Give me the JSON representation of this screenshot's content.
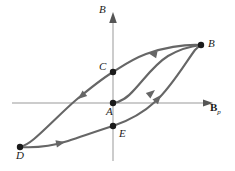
{
  "figure": {
    "type": "hysteresis-loop-diagram",
    "title": "",
    "background_color": "#ffffff",
    "curve_color": "#666666",
    "axis_color": "#999999",
    "point_color": "#1a1a1a",
    "text_color": "#1a1a1a"
  },
  "axes": {
    "y": {
      "label": "B",
      "label_x": 99,
      "label_y": 4,
      "line_x": 113,
      "line_top": 14,
      "line_bottom": 161,
      "arrow": "up"
    },
    "x": {
      "label": "B",
      "label_subscript": "p",
      "label_x": 210,
      "label_y": 102,
      "line_y": 103,
      "line_left": 12,
      "line_right": 213,
      "arrow": "right"
    }
  },
  "points": [
    {
      "name": "A",
      "label": "A",
      "x": 113,
      "y": 103,
      "label_x": 106,
      "label_y": 106
    },
    {
      "name": "B",
      "label": "B",
      "x": 201,
      "y": 45,
      "label_x": 208,
      "label_y": 38
    },
    {
      "name": "C",
      "label": "C",
      "x": 113,
      "y": 72,
      "label_x": 99,
      "label_y": 61
    },
    {
      "name": "D",
      "label": "D",
      "x": 20,
      "y": 147,
      "label_x": 16,
      "label_y": 150
    },
    {
      "name": "E",
      "label": "E",
      "x": 113,
      "y": 126,
      "label_x": 119,
      "label_y": 128
    }
  ],
  "curves": [
    {
      "name": "initial-magnetization-curve",
      "from": "A",
      "to": "B",
      "path": "M 113 103 C 122 102 128 97 135 89 C 145 78 155 64 168 56 C 180 49 192 46 201 45",
      "direction": "A-to-B"
    },
    {
      "name": "descending-branch",
      "from": "B",
      "to": "D",
      "path": "M 201 45 C 184 44 162 48 146 54 C 130 60 120 68 113 72 C 100 80 88 90 76 100 C 62 112 46 129 34 139 C 28 144 24 146 20 147",
      "direction": "B-to-C-to-D"
    },
    {
      "name": "ascending-branch",
      "from": "D",
      "to": "B",
      "path": "M 20 147 C 34 148 52 146 68 141 C 86 135 100 130 113 126 C 128 121 142 114 156 101 C 172 86 186 62 195 50 C 198 47 200 45 201 45",
      "direction": "D-to-E-to-B"
    }
  ],
  "arrow_markers": [
    {
      "name": "arrow-initial-curve-up-right",
      "x": 155,
      "y": 90,
      "angle": -40,
      "on_curve": "initial-magnetization-curve"
    },
    {
      "name": "arrow-descending-branch-left",
      "x": 148,
      "y": 53,
      "angle": 191,
      "on_curve": "descending-branch"
    },
    {
      "name": "arrow-descending-branch-down-left",
      "x": 78,
      "y": 99,
      "angle": 140,
      "on_curve": "descending-branch"
    },
    {
      "name": "arrow-ascending-branch-right",
      "x": 65,
      "y": 142,
      "angle": -12,
      "on_curve": "ascending-branch"
    },
    {
      "name": "arrow-ascending-branch-up-right",
      "x": 161,
      "y": 95,
      "angle": -50,
      "on_curve": "ascending-branch"
    }
  ]
}
